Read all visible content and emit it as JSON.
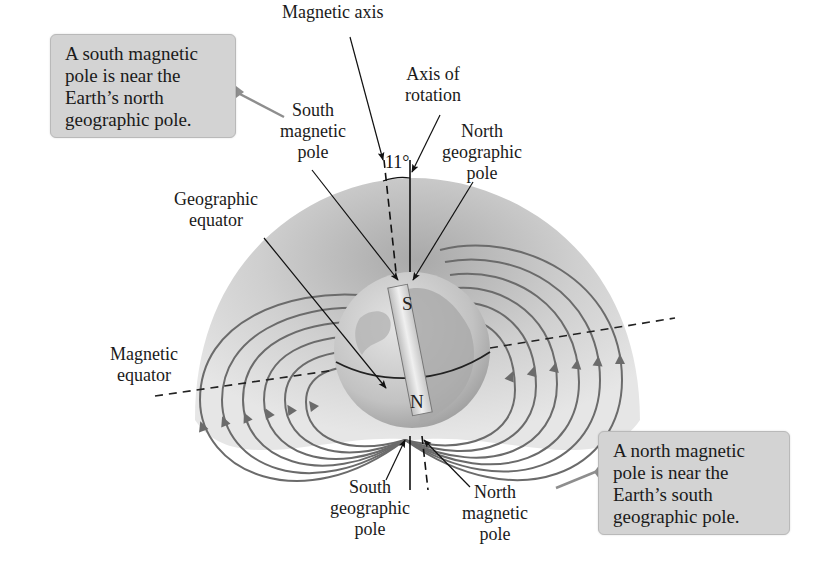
{
  "diagram": {
    "angle_label": "11°",
    "magnet_labels": {
      "top": "S",
      "bottom": "N"
    },
    "callouts": [
      {
        "id": "south-magnetic-callout",
        "lines": [
          "A south magnetic",
          "pole is near the",
          "Earth’s north",
          "geographic pole."
        ]
      },
      {
        "id": "north-magnetic-callout",
        "lines": [
          "A north magnetic",
          "pole is near the",
          "Earth’s south",
          "geographic pole."
        ]
      }
    ],
    "labels": {
      "magnetic_axis": [
        "Magnetic axis"
      ],
      "axis_of_rotation": [
        "Axis of",
        "rotation"
      ],
      "south_magnetic_pole": [
        "South",
        "magnetic",
        "pole"
      ],
      "north_geographic_pole": [
        "North",
        "geographic",
        "pole"
      ],
      "geographic_equator": [
        "Geographic",
        "equator"
      ],
      "magnetic_equator": [
        "Magnetic",
        "equator"
      ],
      "south_geographic_pole": [
        "South",
        "geographic",
        "pole"
      ],
      "north_magnetic_pole": [
        "North",
        "magnetic",
        "pole"
      ]
    },
    "colors": {
      "background": "#ffffff",
      "callout_fill": "#d3d3d3",
      "field_line": "#6b6b6b",
      "field_region": "#d9d9d9",
      "globe_ocean": "#c8c8c8",
      "globe_land": "#a9a9a9",
      "text": "#1a1a1a"
    }
  }
}
